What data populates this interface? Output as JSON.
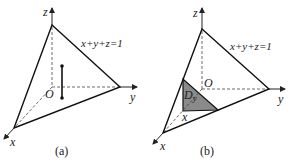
{
  "figures": [
    {
      "id": "a",
      "caption": "(a)",
      "plane_label": "x+y+z=1",
      "axis_labels": {
        "x": "x",
        "y": "y",
        "z": "z"
      },
      "origin_label": "O",
      "has_vertical_segment": true
    },
    {
      "id": "b",
      "caption": "(b)",
      "plane_label": "x+y+z=1",
      "axis_labels": {
        "x": "x",
        "y": "y",
        "z": "z"
      },
      "origin_label": "O",
      "region_label": "D",
      "region_subscript": "y",
      "cross_section_x_label": "x",
      "region_fill": "#8a8a8a"
    }
  ]
}
